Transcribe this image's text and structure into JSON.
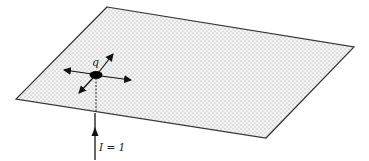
{
  "diagram": {
    "plane": {
      "corners": [
        [
          107,
          7
        ],
        [
          354,
          47
        ],
        [
          266,
          138
        ],
        [
          16,
          99
        ]
      ],
      "fill_pattern": "stippled",
      "edge_color": "#333333"
    },
    "charge": {
      "label": "q",
      "center": [
        96,
        75
      ]
    },
    "current": {
      "label": "I = 1",
      "direction": "upward"
    },
    "radial_arrows": 4
  }
}
